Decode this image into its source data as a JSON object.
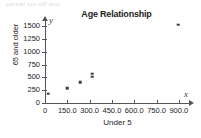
{
  "top_artifact_text": "partial cut-off text",
  "chart_data": {
    "type": "scatter",
    "title": "Age Relationship",
    "xlabel": "Under 5",
    "ylabel": "65 and older",
    "x_var_symbol": "x",
    "y_var_symbol": "y",
    "xlim": [
      0,
      975
    ],
    "ylim": [
      0,
      1560
    ],
    "grid": false,
    "legend": null,
    "x_ticks": [
      0,
      150,
      300,
      450,
      600,
      750,
      900
    ],
    "x_tick_labels": [
      "0",
      "150.0",
      "300.0",
      "450.0",
      "600.0",
      "750.0",
      "900.0"
    ],
    "y_ticks": [
      0,
      250,
      500,
      750,
      1000,
      1250,
      1500
    ],
    "y_tick_labels": [
      "0",
      "250",
      "500",
      "750",
      "1000",
      "1250",
      "1500"
    ],
    "marker": "square",
    "marker_color": "#3d3d3d",
    "points": [
      {
        "x": 20,
        "y": 180
      },
      {
        "x": 148,
        "y": 290
      },
      {
        "x": 235,
        "y": 400
      },
      {
        "x": 316,
        "y": 510
      },
      {
        "x": 316,
        "y": 570
      },
      {
        "x": 895,
        "y": 1530
      }
    ]
  }
}
